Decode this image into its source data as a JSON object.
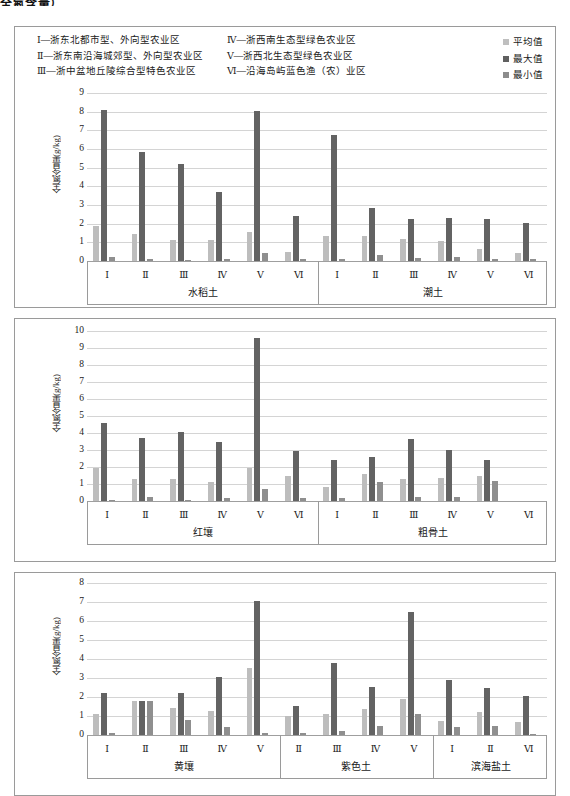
{
  "top_title": "全氮含量）",
  "legend": {
    "regions_col1": [
      "Ⅰ—浙东北都市型、外向型农业区",
      "Ⅱ—浙东南沿海城郊型、外向型农业区",
      "Ⅲ—浙中盆地丘陵综合型特色农业区"
    ],
    "regions_col2": [
      "Ⅳ—浙西南生态型绿色农业区",
      "Ⅴ—浙西北生态型绿色农业区",
      "Ⅵ—沿海岛屿蓝色渔（农）业区"
    ],
    "keys": [
      {
        "label": "平均值",
        "color": "#bdbdbd",
        "icon": "square-swatch-icon"
      },
      {
        "label": "最大值",
        "color": "#636363",
        "icon": "square-swatch-icon"
      },
      {
        "label": "最小值",
        "color": "#8f8f8f",
        "icon": "square-swatch-icon"
      }
    ]
  },
  "chart_data": [
    {
      "id": "chart-1",
      "type": "bar",
      "title": "",
      "xlabel": "",
      "ylabel": "全氮含量(g/kg)",
      "ylim": [
        0,
        9
      ],
      "yticks": [
        0,
        1,
        2,
        3,
        4,
        5,
        6,
        7,
        8,
        9
      ],
      "grid": true,
      "legend_position": "top-right",
      "panels": [
        {
          "name": "水稻土",
          "categories": [
            "Ⅰ",
            "Ⅱ",
            "Ⅲ",
            "Ⅳ",
            "Ⅴ",
            "Ⅵ"
          ],
          "series": [
            {
              "name": "平均值",
              "values": [
                1.85,
                1.47,
                1.15,
                1.13,
                1.53,
                0.5
              ]
            },
            {
              "name": "最大值",
              "values": [
                8.1,
                5.83,
                5.22,
                3.71,
                8.05,
                2.42
              ]
            },
            {
              "name": "最小值",
              "values": [
                0.2,
                0.12,
                0.06,
                0.09,
                0.42,
                0.11
              ]
            }
          ]
        },
        {
          "name": "潮土",
          "categories": [
            "Ⅰ",
            "Ⅱ",
            "Ⅲ",
            "Ⅳ",
            "Ⅴ",
            "Ⅵ"
          ],
          "series": [
            {
              "name": "平均值",
              "values": [
                1.32,
                1.32,
                1.18,
                1.07,
                0.63,
                0.41
              ]
            },
            {
              "name": "最大值",
              "values": [
                6.73,
                2.86,
                2.27,
                2.3,
                2.25,
                2.02
              ]
            },
            {
              "name": "最小值",
              "values": [
                0.1,
                0.34,
                0.16,
                0.22,
                0.11,
                0.12
              ]
            }
          ]
        }
      ]
    },
    {
      "id": "chart-2",
      "type": "bar",
      "title": "",
      "xlabel": "",
      "ylabel": "全氮含量(g/kg)",
      "ylim": [
        0,
        10
      ],
      "yticks": [
        0,
        1,
        2,
        3,
        4,
        5,
        6,
        7,
        8,
        9,
        10
      ],
      "grid": true,
      "panels": [
        {
          "name": "红壤",
          "categories": [
            "Ⅰ",
            "Ⅱ",
            "Ⅲ",
            "Ⅳ",
            "Ⅴ",
            "Ⅵ"
          ],
          "series": [
            {
              "name": "平均值",
              "values": [
                1.96,
                1.27,
                1.3,
                1.13,
                1.93,
                1.49
              ]
            },
            {
              "name": "最大值",
              "values": [
                4.56,
                3.7,
                4.08,
                3.5,
                9.58,
                2.93
              ]
            },
            {
              "name": "最小值",
              "values": [
                0.08,
                0.24,
                0.08,
                0.16,
                0.7,
                0.15
              ]
            }
          ]
        },
        {
          "name": "粗骨土",
          "categories": [
            "Ⅰ",
            "Ⅱ",
            "Ⅲ",
            "Ⅳ",
            "Ⅴ",
            "Ⅵ"
          ],
          "series": [
            {
              "name": "平均值",
              "values": [
                0.82,
                1.59,
                1.27,
                1.34,
                1.49,
                null
              ]
            },
            {
              "name": "最大值",
              "values": [
                2.4,
                2.58,
                3.62,
                3.02,
                2.41,
                null
              ]
            },
            {
              "name": "最小值",
              "values": [
                0.16,
                1.09,
                0.25,
                0.23,
                1.19,
                null
              ]
            }
          ]
        }
      ]
    },
    {
      "id": "chart-3",
      "type": "bar",
      "title": "",
      "xlabel": "",
      "ylabel": "全氮含量(g/kg)",
      "ylim": [
        0,
        8
      ],
      "yticks": [
        0,
        1,
        2,
        3,
        4,
        5,
        6,
        7,
        8
      ],
      "grid": true,
      "panels": [
        {
          "name": "黄壤",
          "categories": [
            "Ⅰ",
            "Ⅱ",
            "Ⅲ",
            "Ⅳ",
            "Ⅴ"
          ],
          "series": [
            {
              "name": "平均值",
              "values": [
                1.1,
                1.79,
                1.43,
                1.26,
                3.54
              ]
            },
            {
              "name": "最大值",
              "values": [
                2.21,
                1.79,
                2.22,
                3.06,
                7.07
              ]
            },
            {
              "name": "最小值",
              "values": [
                0.09,
                1.79,
                0.81,
                0.41,
                0.09
              ]
            }
          ]
        },
        {
          "name": "紫色土",
          "categories": [
            "Ⅱ",
            "Ⅲ",
            "Ⅳ",
            "Ⅴ"
          ],
          "series": [
            {
              "name": "平均值",
              "values": [
                1.02,
                1.08,
                1.39,
                1.89
              ]
            },
            {
              "name": "最大值",
              "values": [
                1.54,
                3.77,
                2.52,
                6.47
              ]
            },
            {
              "name": "最小值",
              "values": [
                0.12,
                0.21,
                0.47,
                1.11
              ]
            }
          ]
        },
        {
          "name": "滨海盐土",
          "categories": [
            "Ⅰ",
            "Ⅱ",
            "Ⅵ"
          ],
          "series": [
            {
              "name": "平均值",
              "values": [
                0.75,
                1.19,
                0.71
              ]
            },
            {
              "name": "最大值",
              "values": [
                2.91,
                2.45,
                2.07
              ]
            },
            {
              "name": "最小值",
              "values": [
                0.44,
                0.47,
                0.07
              ]
            }
          ]
        }
      ]
    }
  ]
}
